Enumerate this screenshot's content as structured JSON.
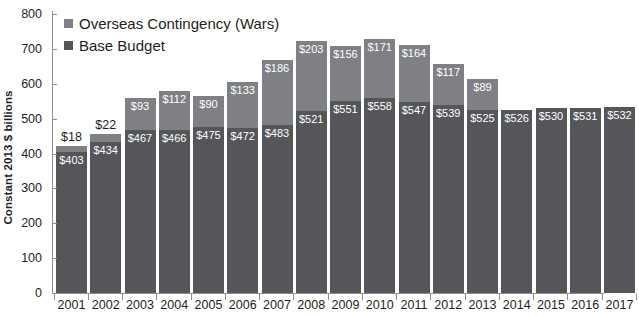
{
  "chart_data": {
    "type": "bar",
    "stacked": true,
    "title": "",
    "xlabel": "",
    "ylabel": "Constant 2013 $ billions",
    "ylim": [
      0,
      800
    ],
    "ytick_step": 100,
    "yticks": [
      "800",
      "700",
      "600",
      "500",
      "400",
      "300",
      "200",
      "100",
      "0"
    ],
    "grid": false,
    "legend_position": "top-left",
    "legend": [
      {
        "name": "Overseas Contingency (Wars)",
        "color": "#7f8084"
      },
      {
        "name": "Base Budget",
        "color": "#55565a"
      }
    ],
    "categories": [
      "2001",
      "2002",
      "2003",
      "2004",
      "2005",
      "2006",
      "2007",
      "2008",
      "2009",
      "2010",
      "2011",
      "2012",
      "2013",
      "2014",
      "2015",
      "2016",
      "2017"
    ],
    "series": [
      {
        "name": "Base Budget",
        "color": "#55565a",
        "values": [
          403,
          434,
          467,
          466,
          475,
          472,
          483,
          521,
          551,
          558,
          547,
          539,
          525,
          526,
          530,
          531,
          532
        ],
        "labels": [
          "$403",
          "$434",
          "$467",
          "$466",
          "$475",
          "$472",
          "$483",
          "$521",
          "$551",
          "$558",
          "$547",
          "$539",
          "$525",
          "$526",
          "$530",
          "$531",
          "$532"
        ]
      },
      {
        "name": "Overseas Contingency (Wars)",
        "color": "#7f8084",
        "values": [
          18,
          22,
          93,
          112,
          90,
          133,
          186,
          203,
          156,
          171,
          164,
          117,
          89,
          0,
          0,
          0,
          0
        ],
        "labels": [
          "$18",
          "$22",
          "$93",
          "$112",
          "$90",
          "$133",
          "$186",
          "$203",
          "$156",
          "$171",
          "$164",
          "$117",
          "$89",
          "",
          "",
          "",
          ""
        ]
      }
    ],
    "totals": [
      421,
      456,
      560,
      578,
      565,
      605,
      669,
      724,
      707,
      729,
      711,
      656,
      614,
      526,
      530,
      531,
      532
    ]
  }
}
